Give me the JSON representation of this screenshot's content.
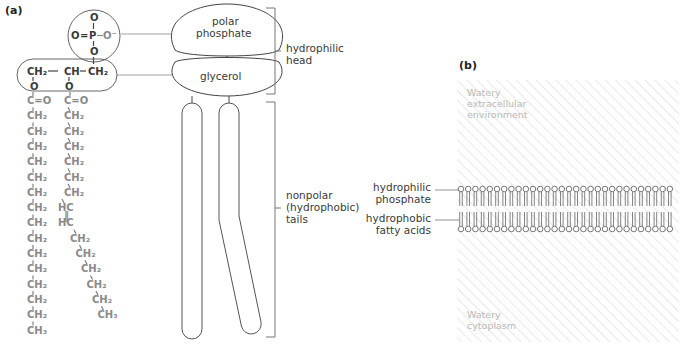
{
  "panel_a": {
    "label": "(a)",
    "phosphate": {
      "top_o": "O",
      "double_o": "O",
      "eq": "=",
      "p": "P",
      "dash": "—",
      "o_minus": "O⁻",
      "bottom_o": "O"
    },
    "glycerol": {
      "ch2_left": "CH₂",
      "ch_mid": "CH",
      "ch2_right": "CH₂",
      "o_left": "O",
      "o_mid": "O"
    },
    "chain_left": [
      "C=O",
      "CH₂",
      "CH₂",
      "CH₂",
      "CH₂",
      "CH₂",
      "CH₂",
      "CH₂",
      "CH₂",
      "CH₂",
      "CH₂",
      "CH₂",
      "CH₂",
      "CH₂",
      "CH₂",
      "CH₃"
    ],
    "chain_right": [
      "C=O",
      "CH₂",
      "CH₂",
      "CH₂",
      "CH₂",
      "CH₂",
      "CH₂",
      "HC",
      "HC",
      "CH₂",
      "CH₂",
      "CH₂",
      "CH₂",
      "CH₂",
      "CH₃"
    ],
    "labels": {
      "polar_phosphate_1": "polar",
      "polar_phosphate_2": "phosphate",
      "glycerol": "glycerol",
      "head_1": "hydrophilic",
      "head_2": "head",
      "tails_1": "nonpolar",
      "tails_2": "(hydrophobic)",
      "tails_3": "tails"
    }
  },
  "panel_b": {
    "label": "(b)",
    "extracellular_1": "Watery",
    "extracellular_2": "extracellular",
    "extracellular_3": "environment",
    "cytoplasm_1": "Watery",
    "cytoplasm_2": "cytoplasm",
    "phosphate_1": "hydrophilic",
    "phosphate_2": "phosphate",
    "fatty_1": "hydrophobic",
    "fatty_2": "fatty acids"
  },
  "colors": {
    "line": "#555555",
    "text": "#3a3a3a",
    "hatch": "#e4e4e4",
    "env_text": "#b8b8b8"
  }
}
